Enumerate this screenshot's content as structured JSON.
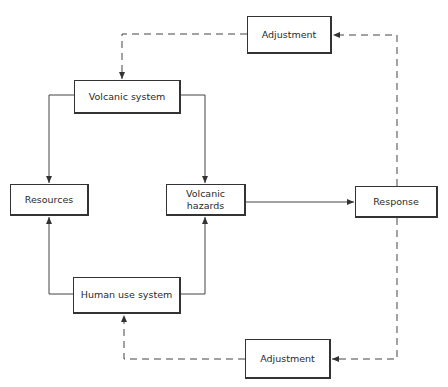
{
  "diagram": {
    "nodes": {
      "adjustment_top": {
        "label": "Adjustment"
      },
      "volcanic_system": {
        "label": "Volcanic system"
      },
      "resources": {
        "label": "Resources"
      },
      "volcanic_hazards": {
        "label": "Volcanic hazards"
      },
      "response": {
        "label": "Response"
      },
      "human_use_system": {
        "label": "Human use system"
      },
      "adjustment_bottom": {
        "label": "Adjustment"
      }
    },
    "edges": [
      {
        "from": "volcanic_system",
        "to": "resources",
        "style": "solid"
      },
      {
        "from": "volcanic_system",
        "to": "volcanic_hazards",
        "style": "solid"
      },
      {
        "from": "human_use_system",
        "to": "resources",
        "style": "solid"
      },
      {
        "from": "human_use_system",
        "to": "volcanic_hazards",
        "style": "solid"
      },
      {
        "from": "volcanic_hazards",
        "to": "response",
        "style": "solid"
      },
      {
        "from": "response",
        "to": "adjustment_top",
        "style": "dashed"
      },
      {
        "from": "adjustment_top",
        "to": "volcanic_system",
        "style": "dashed"
      },
      {
        "from": "response",
        "to": "adjustment_bottom",
        "style": "dashed"
      },
      {
        "from": "adjustment_bottom",
        "to": "human_use_system",
        "style": "dashed"
      }
    ]
  }
}
